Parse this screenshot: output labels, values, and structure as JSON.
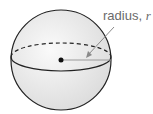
{
  "diagram": {
    "type": "sphere",
    "label": "radius, ",
    "variable": "r",
    "colors": {
      "fill": "#ececec",
      "stroke": "#222222",
      "radius_line": "#9a9a9a",
      "arrow": "#8a8a8a"
    }
  }
}
